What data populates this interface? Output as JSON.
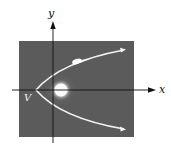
{
  "diagram": {
    "type": "parabolic-orbit",
    "labels": {
      "x_axis": "x",
      "y_axis": "y",
      "vertex": "V"
    },
    "elements": [
      "coordinate-axes",
      "sun",
      "parabolic-orbit",
      "comet",
      "vertex-label"
    ],
    "colors": {
      "panel": "#5b5b5b",
      "orbit": "#f2f2f2",
      "sun": "#f5f5f5",
      "axis": "#111111",
      "background": "#ffffff"
    }
  }
}
